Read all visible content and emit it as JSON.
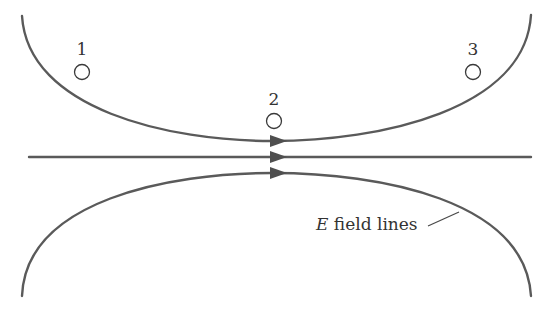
{
  "figure": {
    "line_color": "#5a5a5a",
    "background": "#ffffff"
  },
  "field_lines": [
    {
      "id": "upper",
      "direction": "left-to-right",
      "shape": "curve bending downward toward center"
    },
    {
      "id": "middle",
      "direction": "left-to-right",
      "shape": "straight horizontal"
    },
    {
      "id": "lower",
      "direction": "left-to-right",
      "shape": "curve bending upward toward center"
    }
  ],
  "points": [
    {
      "label": "1",
      "position": "upper-left, above upper field line"
    },
    {
      "label": "2",
      "position": "center, just above upper field line minimum"
    },
    {
      "label": "3",
      "position": "upper-right, above upper field line"
    }
  ],
  "caption": {
    "italic_part": "E",
    "rest": " field lines"
  }
}
